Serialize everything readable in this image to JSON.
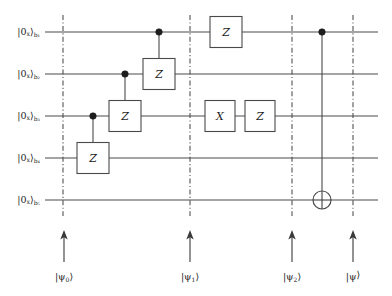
{
  "figure": {
    "kind": "quantum-circuit-diagram",
    "qubit_count": 5,
    "width": 392,
    "height": 296,
    "background": "#ffffff",
    "line_color": "#4a4a4a",
    "text_color": "#1d1d1d"
  },
  "qubits": [
    {
      "id": "b1",
      "label_ket": "|0",
      "label_basis": "x",
      "label_close": "⟩",
      "label_sub": "b₁",
      "y": 32
    },
    {
      "id": "b2",
      "label_ket": "|0",
      "label_basis": "x",
      "label_close": "⟩",
      "label_sub": "b₂",
      "y": 74
    },
    {
      "id": "b3",
      "label_ket": "|0",
      "label_basis": "x",
      "label_close": "⟩",
      "label_sub": "b₃",
      "y": 116
    },
    {
      "id": "b4",
      "label_ket": "|0",
      "label_basis": "x",
      "label_close": "⟩",
      "label_sub": "b₄",
      "y": 158
    },
    {
      "id": "b5",
      "label_ket": "|0",
      "label_basis": "x",
      "label_close": "⟩",
      "label_sub": "b₅",
      "y": 200
    }
  ],
  "wire_span": {
    "x_start": 45,
    "x_end": 378
  },
  "barriers": [
    {
      "id": "barrier-psi0",
      "x": 63,
      "y_top": 15,
      "y_bottom": 216
    },
    {
      "id": "barrier-psi1",
      "x": 190,
      "y_top": 15,
      "y_bottom": 216
    },
    {
      "id": "barrier-psi2",
      "x": 292,
      "y_top": 15,
      "y_bottom": 216
    },
    {
      "id": "barrier-psi",
      "x": 353,
      "y_top": 15,
      "y_bottom": 216
    }
  ],
  "gates": [
    {
      "id": "cz-b3-b4",
      "type": "controlled-z",
      "label": "Z",
      "control_y": 116,
      "target_y": 158,
      "x": 93,
      "box_w": 32,
      "box_h": 31
    },
    {
      "id": "cz-b2-b3",
      "type": "controlled-z",
      "label": "Z",
      "control_y": 74,
      "target_y": 116,
      "x": 125,
      "box_w": 32,
      "box_h": 31
    },
    {
      "id": "cz-b1-b2",
      "type": "controlled-z",
      "label": "Z",
      "control_y": 32,
      "target_y": 74,
      "x": 159,
      "box_w": 32,
      "box_h": 31
    },
    {
      "id": "z-b1",
      "type": "single",
      "label": "Z",
      "wire_y": 32,
      "x": 226,
      "box_w": 32,
      "box_h": 31
    },
    {
      "id": "x-b3",
      "type": "single",
      "label": "X",
      "wire_y": 116,
      "x": 220,
      "box_w": 30,
      "box_h": 31
    },
    {
      "id": "z-b3",
      "type": "single",
      "label": "Z",
      "wire_y": 116,
      "x": 260,
      "box_w": 30,
      "box_h": 31
    },
    {
      "id": "cnot-b1-b5",
      "type": "controlled-not",
      "label": "⊕",
      "control_y": 32,
      "target_y": 200,
      "x": 322,
      "target_r": 9
    }
  ],
  "state_markers": [
    {
      "id": "marker-psi0",
      "x": 64,
      "label_main": "|ψ",
      "label_sub": "0",
      "label_close": "⟩",
      "arrow_top": 232,
      "arrow_bottom": 262,
      "label_y": 277
    },
    {
      "id": "marker-psi1",
      "x": 190,
      "label_main": "|ψ",
      "label_sub": "1",
      "label_close": "⟩",
      "arrow_top": 232,
      "arrow_bottom": 262,
      "label_y": 277
    },
    {
      "id": "marker-psi2",
      "x": 292,
      "label_main": "|ψ",
      "label_sub": "2",
      "label_close": "⟩",
      "arrow_top": 232,
      "arrow_bottom": 262,
      "label_y": 277
    },
    {
      "id": "marker-psi",
      "x": 353,
      "label_main": "|ψ",
      "label_sub": "",
      "label_close": "⟩",
      "arrow_top": 232,
      "arrow_bottom": 262,
      "label_y": 277
    }
  ]
}
